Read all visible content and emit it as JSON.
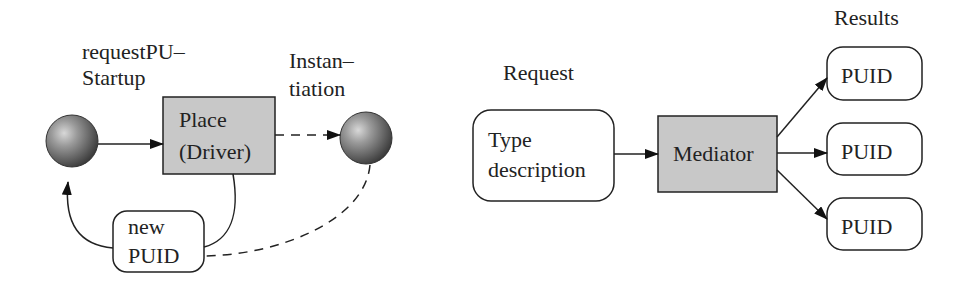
{
  "left_diagram": {
    "label_request_startup": [
      "requestPU–",
      "Startup"
    ],
    "label_instantiation": [
      "Instan–",
      "tiation"
    ],
    "place_box": [
      "Place",
      "(Driver)"
    ],
    "new_puid_box": [
      "new",
      "PUID"
    ]
  },
  "right_diagram": {
    "label_request": "Request",
    "label_results": "Results",
    "type_box": [
      "Type",
      "description"
    ],
    "mediator_box": "Mediator",
    "result_boxes": [
      "PUID",
      "PUID",
      "PUID"
    ]
  },
  "colors": {
    "box_fill": "#c8c8c8",
    "stroke": "#222222",
    "sphere": "#7a7a7a"
  }
}
